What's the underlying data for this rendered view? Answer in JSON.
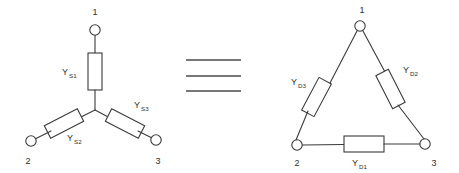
{
  "figure": {
    "equivalence_symbol": "identity-three-bars",
    "line_color": "#3a3a3a",
    "background_color": "#ffffff"
  },
  "wye": {
    "name": "wye-network",
    "nodes": [
      {
        "id": "wye-node-1",
        "label": "1"
      },
      {
        "id": "wye-node-2",
        "label": "2"
      },
      {
        "id": "wye-node-3",
        "label": "3"
      }
    ],
    "elements": [
      {
        "id": "wye-element-ys1",
        "symbol": "Y",
        "subscript": "S1"
      },
      {
        "id": "wye-element-ys2",
        "symbol": "Y",
        "subscript": "S2"
      },
      {
        "id": "wye-element-ys3",
        "symbol": "Y",
        "subscript": "S3"
      }
    ]
  },
  "delta": {
    "name": "delta-network",
    "nodes": [
      {
        "id": "delta-node-1",
        "label": "1"
      },
      {
        "id": "delta-node-2",
        "label": "2"
      },
      {
        "id": "delta-node-3",
        "label": "3"
      }
    ],
    "elements": [
      {
        "id": "delta-element-yd1",
        "symbol": "Y",
        "subscript": "D1"
      },
      {
        "id": "delta-element-yd2",
        "symbol": "Y",
        "subscript": "D2"
      },
      {
        "id": "delta-element-yd3",
        "symbol": "Y",
        "subscript": "D3"
      }
    ]
  }
}
